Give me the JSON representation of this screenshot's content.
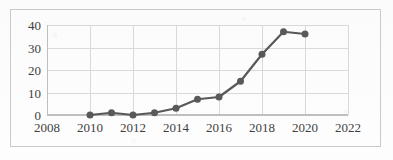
{
  "figure": {
    "background_color": "#fdfdfd",
    "frame_color": "#c9c9c9",
    "grid_color": "#d9d9d9",
    "axis_color": "#bfbfbf",
    "tick_label_color": "#3f3f3f"
  },
  "chart_data": {
    "type": "line",
    "title": "",
    "subtitle": "",
    "xlabel": "",
    "ylabel": "",
    "x": [
      2010,
      2011,
      2012,
      2013,
      2014,
      2015,
      2016,
      2017,
      2018,
      2019,
      2020
    ],
    "values": [
      0,
      1,
      0,
      1,
      3,
      7,
      8,
      15,
      27,
      37,
      36
    ],
    "series": [
      {
        "name": "",
        "x": [
          2010,
          2011,
          2012,
          2013,
          2014,
          2015,
          2016,
          2017,
          2018,
          2019,
          2020
        ],
        "values": [
          0,
          1,
          0,
          1,
          3,
          7,
          8,
          15,
          27,
          37,
          36
        ],
        "color": "#595959",
        "marker": "circle",
        "line_width": 2.2,
        "marker_size": 7
      }
    ],
    "xlim": [
      2008,
      2022
    ],
    "ylim": [
      0,
      40
    ],
    "xticks": [
      2008,
      2010,
      2012,
      2014,
      2016,
      2018,
      2020,
      2022
    ],
    "xtick_labels": [
      "2008",
      "2010",
      "2012",
      "2014",
      "2016",
      "2018",
      "2020",
      "2022"
    ],
    "yticks": [
      0,
      10,
      20,
      30,
      40
    ],
    "ytick_labels": [
      "0",
      "10",
      "20",
      "30",
      "40"
    ],
    "grid": true,
    "grid_axes": "both",
    "legend": false,
    "legend_position": "none",
    "annotations": []
  }
}
